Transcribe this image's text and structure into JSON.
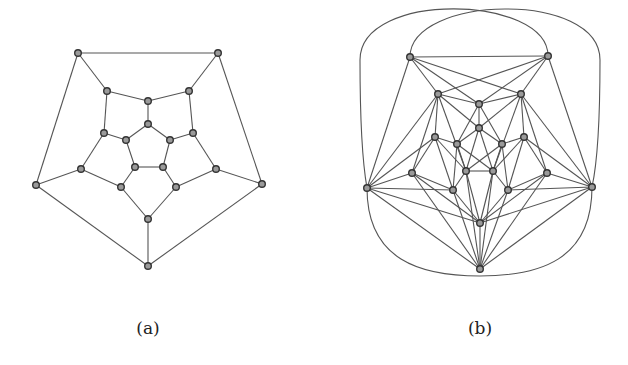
{
  "figure": {
    "panels": [
      {
        "id": "a",
        "caption": "(a)",
        "caption_pos": [
          148,
          318
        ],
        "nodes": [
          [
            78,
            53
          ],
          [
            218,
            53
          ],
          [
            107,
            91
          ],
          [
            189,
            91
          ],
          [
            148,
            101
          ],
          [
            148,
            124
          ],
          [
            104,
            133
          ],
          [
            193,
            133
          ],
          [
            126,
            140
          ],
          [
            170,
            140
          ],
          [
            135,
            167
          ],
          [
            163,
            167
          ],
          [
            81,
            169
          ],
          [
            216,
            169
          ],
          [
            36,
            185
          ],
          [
            262,
            184
          ],
          [
            121,
            187
          ],
          [
            176,
            187
          ],
          [
            148,
            219
          ],
          [
            148,
            266
          ]
        ],
        "edges": [
          [
            0,
            1
          ],
          [
            0,
            2
          ],
          [
            1,
            3
          ],
          [
            0,
            14
          ],
          [
            1,
            15
          ],
          [
            2,
            4
          ],
          [
            3,
            4
          ],
          [
            2,
            6
          ],
          [
            3,
            7
          ],
          [
            4,
            5
          ],
          [
            5,
            8
          ],
          [
            5,
            9
          ],
          [
            6,
            8
          ],
          [
            7,
            9
          ],
          [
            6,
            12
          ],
          [
            7,
            13
          ],
          [
            8,
            10
          ],
          [
            9,
            11
          ],
          [
            10,
            11
          ],
          [
            10,
            16
          ],
          [
            11,
            17
          ],
          [
            12,
            14
          ],
          [
            13,
            15
          ],
          [
            12,
            16
          ],
          [
            13,
            17
          ],
          [
            16,
            18
          ],
          [
            17,
            18
          ],
          [
            18,
            19
          ],
          [
            14,
            19
          ],
          [
            15,
            19
          ]
        ],
        "arcs": []
      },
      {
        "id": "b",
        "caption": "(b)",
        "caption_pos": [
          480,
          318
        ],
        "nodes": [
          [
            410,
            57
          ],
          [
            548,
            56
          ],
          [
            438,
            94
          ],
          [
            521,
            94
          ],
          [
            479,
            104
          ],
          [
            479,
            128
          ],
          [
            435,
            137
          ],
          [
            524,
            137
          ],
          [
            457,
            144
          ],
          [
            502,
            144
          ],
          [
            466,
            171
          ],
          [
            493,
            171
          ],
          [
            412,
            173
          ],
          [
            547,
            173
          ],
          [
            367,
            188
          ],
          [
            592,
            187
          ],
          [
            453,
            190
          ],
          [
            508,
            190
          ],
          [
            480,
            223
          ],
          [
            480,
            269
          ]
        ],
        "edges": [
          [
            0,
            1
          ],
          [
            0,
            2
          ],
          [
            1,
            3
          ],
          [
            0,
            14
          ],
          [
            1,
            15
          ],
          [
            2,
            4
          ],
          [
            3,
            4
          ],
          [
            2,
            6
          ],
          [
            3,
            7
          ],
          [
            4,
            5
          ],
          [
            5,
            8
          ],
          [
            5,
            9
          ],
          [
            6,
            8
          ],
          [
            7,
            9
          ],
          [
            6,
            12
          ],
          [
            7,
            13
          ],
          [
            8,
            10
          ],
          [
            9,
            11
          ],
          [
            10,
            11
          ],
          [
            10,
            16
          ],
          [
            11,
            17
          ],
          [
            12,
            14
          ],
          [
            13,
            15
          ],
          [
            12,
            16
          ],
          [
            13,
            17
          ],
          [
            16,
            18
          ],
          [
            17,
            18
          ],
          [
            18,
            19
          ],
          [
            14,
            19
          ],
          [
            15,
            19
          ],
          [
            0,
            4
          ],
          [
            0,
            3
          ],
          [
            1,
            4
          ],
          [
            1,
            2
          ],
          [
            2,
            14
          ],
          [
            2,
            10
          ],
          [
            2,
            5
          ],
          [
            2,
            12
          ],
          [
            3,
            15
          ],
          [
            3,
            11
          ],
          [
            3,
            5
          ],
          [
            3,
            13
          ],
          [
            4,
            8
          ],
          [
            4,
            9
          ],
          [
            5,
            10
          ],
          [
            5,
            11
          ],
          [
            6,
            14
          ],
          [
            6,
            16
          ],
          [
            6,
            10
          ],
          [
            7,
            15
          ],
          [
            7,
            17
          ],
          [
            7,
            11
          ],
          [
            8,
            16
          ],
          [
            8,
            11
          ],
          [
            9,
            17
          ],
          [
            9,
            10
          ],
          [
            12,
            18
          ],
          [
            13,
            18
          ],
          [
            12,
            19
          ],
          [
            13,
            19
          ],
          [
            14,
            16
          ],
          [
            15,
            17
          ],
          [
            16,
            19
          ],
          [
            17,
            19
          ],
          [
            10,
            18
          ],
          [
            11,
            18
          ],
          [
            10,
            19
          ],
          [
            11,
            19
          ],
          [
            14,
            18
          ],
          [
            15,
            18
          ]
        ],
        "arcs": [
          {
            "from": 0,
            "to": 15,
            "path": "M410,57 C410,-5 600,-10 600,60 C600,120 598,160 592,187"
          },
          {
            "from": 1,
            "to": 14,
            "path": "M548,56 C548,-5 360,-10 360,60 C360,120 362,160 367,188"
          },
          {
            "from": 14,
            "to": 15,
            "path": "M367,188 C367,260 420,276 480,276 C540,276 592,260 592,187"
          }
        ]
      }
    ]
  }
}
